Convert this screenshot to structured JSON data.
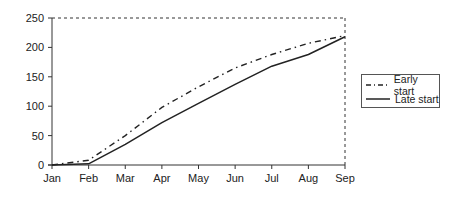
{
  "chart_data": {
    "type": "line",
    "title": "",
    "xlabel": "",
    "ylabel": "",
    "categories": [
      "Jan",
      "Feb",
      "Mar",
      "Apr",
      "May",
      "Jun",
      "Jul",
      "Aug",
      "Sep"
    ],
    "series": [
      {
        "name": "Early start",
        "style": "dash-dot",
        "values": [
          0,
          8,
          50,
          98,
          133,
          165,
          188,
          207,
          220
        ]
      },
      {
        "name": "Late start",
        "style": "solid",
        "values": [
          0,
          2,
          35,
          72,
          105,
          137,
          168,
          188,
          218
        ]
      }
    ],
    "ylim": [
      0,
      250
    ],
    "yticks": [
      0,
      50,
      100,
      150,
      200,
      250
    ],
    "grid": false,
    "legend_position": "right",
    "plot_border": "dashed top and right"
  },
  "legend": {
    "items": [
      {
        "label": "Early start"
      },
      {
        "label": "Late start"
      }
    ]
  },
  "colors": {
    "line": "#222222",
    "axis": "#333333"
  }
}
